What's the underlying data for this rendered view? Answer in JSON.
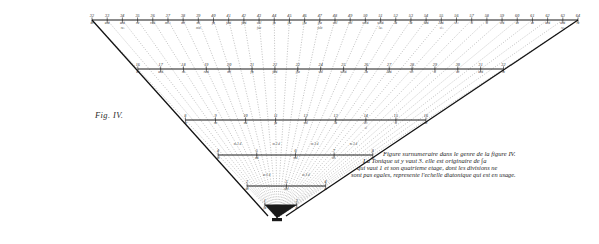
{
  "figure": {
    "label": "Fig. IV.",
    "plate_type": "engraved-geometric-music-diagram"
  },
  "caption": {
    "line1": "Figure surnumeraire dans le genre de la figure IV.",
    "line2": "La Tonique ut y vaut 3. elle est originaire de ∫a",
    "line3": "qui vaut 1 et son quatrieme etage, dont les divisions ne",
    "line4": "sont pas egales, represente l'echelle diatonique qui est en usage."
  },
  "scales": {
    "top_row": {
      "name": "top-graduated-scale",
      "ticks": [
        {
          "num": "32",
          "den": "ut"
        },
        {
          "num": "33",
          "den": "ut♯"
        },
        {
          "num": "34",
          "den": "ut♯",
          "sub": "re♭"
        },
        {
          "num": "35",
          "den": "re"
        },
        {
          "num": "36",
          "den": "re♯"
        },
        {
          "num": "37",
          "den": "mi♭"
        },
        {
          "num": "38",
          "den": "mi"
        },
        {
          "num": "39",
          "den": "mi",
          "sub": "mi♯"
        },
        {
          "num": "40",
          "den": "fa"
        },
        {
          "num": "41",
          "den": "fa♯"
        },
        {
          "num": "42",
          "den": "fa♯"
        },
        {
          "num": "43",
          "den": "sol",
          "sub": "fa♯"
        },
        {
          "num": "44",
          "den": "∫a"
        },
        {
          "num": "45",
          "den": "∫la"
        },
        {
          "num": "46",
          "den": "∫la"
        },
        {
          "num": "47",
          "den": "∫la",
          "sub": "sol♯"
        },
        {
          "num": "48",
          "den": "sol"
        },
        {
          "num": "49",
          "den": "sol"
        },
        {
          "num": "50",
          "den": "sol♯"
        },
        {
          "num": "51",
          "den": "sol♯",
          "sub": "la♭"
        },
        {
          "num": "52",
          "den": "la"
        },
        {
          "num": "53",
          "den": "la"
        },
        {
          "num": "54",
          "den": "la♯"
        },
        {
          "num": "55",
          "den": "la♯",
          "sub": "si♭"
        },
        {
          "num": "56",
          "den": "si♭"
        },
        {
          "num": "57",
          "den": "si"
        },
        {
          "num": "58",
          "den": "si"
        },
        {
          "num": "59",
          "den": "si♯"
        },
        {
          "num": "60",
          "den": "ut"
        },
        {
          "num": "61",
          "den": "ut"
        },
        {
          "num": "62",
          "den": "ut♯"
        },
        {
          "num": "63",
          "den": "ut♯",
          "sub": "re♭"
        },
        {
          "num": "64",
          "den": "re"
        }
      ]
    },
    "second_row": {
      "name": "second-graduated-scale",
      "ticks": [
        {
          "num": "16",
          "den": "ut"
        },
        {
          "num": "17",
          "den": "ut♯"
        },
        {
          "num": "18",
          "den": "re"
        },
        {
          "num": "19",
          "den": "re♯"
        },
        {
          "num": "20",
          "den": "mi"
        },
        {
          "num": "21",
          "den": "fa"
        },
        {
          "num": "22",
          "den": "fa♯"
        },
        {
          "num": "23",
          "den": "∫la"
        },
        {
          "num": "24",
          "den": "sol"
        },
        {
          "num": "25",
          "den": "sol♯"
        },
        {
          "num": "26",
          "den": "la"
        },
        {
          "num": "27",
          "den": "la♯"
        },
        {
          "num": "28",
          "den": "si♭"
        },
        {
          "num": "29",
          "den": "si"
        },
        {
          "num": "30",
          "den": "ut"
        },
        {
          "num": "31",
          "den": "ut♯"
        },
        {
          "num": "32",
          "den": "re"
        }
      ]
    },
    "third_row": {
      "name": "third-graduated-scale",
      "ticks": [
        {
          "num": "8",
          "den": "ut"
        },
        {
          "num": "9",
          "den": "re"
        },
        {
          "num": "10",
          "den": "mi"
        },
        {
          "num": "11",
          "den": "fa"
        },
        {
          "num": "12",
          "den": "sol"
        },
        {
          "num": "13",
          "den": "la"
        },
        {
          "num": "14",
          "den": "si♭",
          "sub": "si"
        },
        {
          "num": "15",
          "den": "si"
        },
        {
          "num": "16",
          "den": "ut"
        }
      ]
    },
    "fourth_row": {
      "name": "fourth-graduated-scale",
      "ticks": [
        {
          "num": "4",
          "den": "ut"
        },
        {
          "num": "5",
          "den": "mi"
        },
        {
          "num": "6",
          "den": "sol"
        },
        {
          "num": "7",
          "den": "si♭"
        },
        {
          "num": "8",
          "den": "ut"
        }
      ],
      "intervals": [
        {
          "text": "m 3 d",
          "pos": 0
        },
        {
          "text": "m 3 d",
          "pos": 1
        },
        {
          "text": "m 3 d",
          "pos": 2
        },
        {
          "text": "m 3 d",
          "pos": 3
        }
      ]
    },
    "fifth_row": {
      "name": "fifth-graduated-scale",
      "ticks": [
        {
          "num": "2",
          "den": "ut"
        },
        {
          "num": "3",
          "den": "sol"
        },
        {
          "num": "4",
          "den": "ut"
        }
      ],
      "intervals": [
        {
          "text": "m 3 d"
        },
        {
          "text": "m 3 d"
        }
      ]
    },
    "sixth_row": {
      "name": "sixth-graduated-scale",
      "ticks": [
        {
          "num": "1",
          "den": "∫a"
        },
        {
          "num": "2",
          "den": "ut"
        }
      ]
    }
  }
}
